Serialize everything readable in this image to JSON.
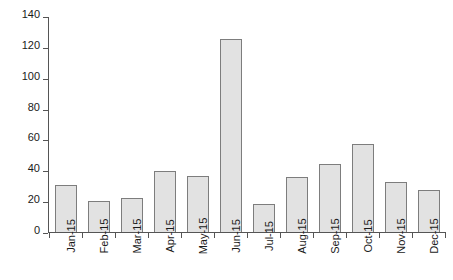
{
  "chart_data": {
    "type": "bar",
    "title": "",
    "subtitle": "",
    "xlabel": "",
    "ylabel": "",
    "categories": [
      "Jan-15",
      "Feb-15",
      "Mar-15",
      "Apr-15",
      "May-15",
      "Jun-15",
      "Jul-15",
      "Aug-15",
      "Sep-15",
      "Oct-15",
      "Nov-15",
      "Dec-15"
    ],
    "values": [
      31,
      21,
      23,
      40,
      37,
      126,
      19,
      36,
      45,
      58,
      33,
      28
    ],
    "ylim": [
      0,
      140
    ],
    "ytick_labels": [
      "140",
      "120",
      "100",
      "80",
      "60",
      "40",
      "20",
      "0"
    ],
    "ytick_values": [
      140,
      120,
      100,
      80,
      60,
      40,
      20,
      0
    ],
    "ytick_step": 20,
    "grid": false,
    "legend": false,
    "legend_position": "none",
    "annotations": [],
    "colors": {
      "bar_fill": "#e2e2e2",
      "bar_stroke": "#7d7d7d",
      "axis": "#555555",
      "text": "#1a1a1a",
      "background": "#ffffff"
    }
  }
}
